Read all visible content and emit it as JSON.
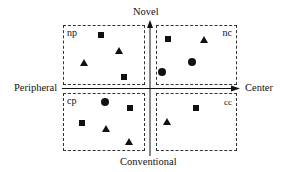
{
  "axes": {
    "top_label": "Novel",
    "bottom_label": "Conventional",
    "left_label": "Peripheral",
    "right_label": "Center"
  },
  "quadrants": [
    {
      "id": "np",
      "label": "np",
      "position": "top-left",
      "markers": [
        {
          "shape": "square",
          "x": 101,
          "y": 35
        },
        {
          "shape": "triangle",
          "x": 119,
          "y": 50
        },
        {
          "shape": "triangle",
          "x": 84,
          "y": 62
        },
        {
          "shape": "square",
          "x": 124,
          "y": 77
        }
      ]
    },
    {
      "id": "nc",
      "label": "nc",
      "position": "top-right",
      "markers": [
        {
          "shape": "square",
          "x": 168,
          "y": 39
        },
        {
          "shape": "triangle",
          "x": 204,
          "y": 39
        },
        {
          "shape": "circle",
          "x": 192,
          "y": 62
        },
        {
          "shape": "circle",
          "x": 162,
          "y": 72
        }
      ]
    },
    {
      "id": "cp",
      "label": "cp",
      "position": "bottom-left",
      "markers": [
        {
          "shape": "circle",
          "x": 105,
          "y": 102
        },
        {
          "shape": "square",
          "x": 130,
          "y": 108
        },
        {
          "shape": "square",
          "x": 82,
          "y": 123
        },
        {
          "shape": "triangle",
          "x": 106,
          "y": 128
        },
        {
          "shape": "triangle",
          "x": 129,
          "y": 141
        }
      ]
    },
    {
      "id": "cc",
      "label": "cc",
      "position": "bottom-right",
      "markers": [
        {
          "shape": "square",
          "x": 196,
          "y": 108
        },
        {
          "shape": "triangle",
          "x": 167,
          "y": 121
        }
      ]
    }
  ],
  "colors": {
    "ink": "#111111",
    "background": "#ffffff"
  }
}
